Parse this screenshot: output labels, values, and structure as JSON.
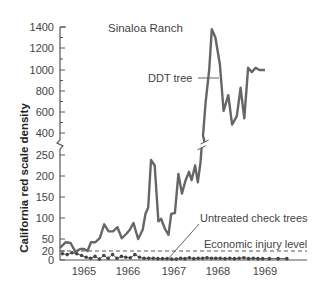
{
  "chart_data": {
    "type": "line",
    "title": "Sinaloa Ranch",
    "xlabel": "",
    "ylabel": "California red scale density",
    "x_tick_labels": [
      "1965",
      "1966",
      "1967",
      "1968",
      "1969"
    ],
    "y_tick_labels_lower": [
      "0",
      "20",
      "50",
      "100",
      "150",
      "200",
      "250"
    ],
    "y_tick_labels_upper": [
      "400",
      "600",
      "800",
      "1000",
      "1200",
      "1400"
    ],
    "y_axis_break": "between 250 and 400",
    "ylim": [
      0,
      1400
    ],
    "xlim": [
      1964.5,
      1969.4
    ],
    "grid": false,
    "legend_position": "inline annotations",
    "annotations": {
      "ddt_tree": "DDT tree",
      "untreated": "Untreated check trees",
      "economic_injury": "Economic injury level"
    },
    "economic_injury_level": 20,
    "series": [
      {
        "name": "DDT tree",
        "style": "thick solid line",
        "color": "#666666",
        "x": [
          1964.5,
          1964.62,
          1964.72,
          1964.82,
          1964.92,
          1965.0,
          1965.08,
          1965.16,
          1965.26,
          1965.36,
          1965.46,
          1965.56,
          1965.66,
          1965.76,
          1965.86,
          1965.96,
          1966.04,
          1966.12,
          1966.22,
          1966.32,
          1966.38,
          1966.44,
          1966.5,
          1966.58,
          1966.66,
          1966.72,
          1966.8,
          1966.88,
          1966.94,
          1967.02,
          1967.1,
          1967.18,
          1967.26,
          1967.34,
          1967.4,
          1967.48,
          1967.54,
          1967.6,
          1967.66,
          1967.72,
          1967.8,
          1967.86,
          1967.94,
          1968.04,
          1968.12,
          1968.22,
          1968.3,
          1968.4,
          1968.48,
          1968.56,
          1968.64,
          1968.72,
          1968.8,
          1968.88,
          1969.0
        ],
        "values": [
          28,
          42,
          40,
          18,
          25,
          25,
          20,
          42,
          42,
          52,
          85,
          68,
          68,
          78,
          52,
          62,
          72,
          88,
          50,
          72,
          110,
          125,
          238,
          225,
          92,
          98,
          75,
          60,
          110,
          112,
          205,
          158,
          188,
          210,
          190,
          225,
          185,
          230,
          380,
          700,
          1000,
          1380,
          1300,
          1050,
          610,
          760,
          480,
          560,
          830,
          540,
          1020,
          980,
          1020,
          1000,
          1000
        ]
      },
      {
        "name": "Untreated check trees",
        "style": "thin line with dot markers",
        "color": "#555555",
        "x": [
          1964.55,
          1964.65,
          1964.75,
          1964.85,
          1964.95,
          1965.05,
          1965.15,
          1965.25,
          1965.35,
          1965.45,
          1965.55,
          1965.65,
          1965.75,
          1965.85,
          1965.95,
          1966.05,
          1966.15,
          1966.25,
          1966.35,
          1966.45,
          1966.55,
          1966.65,
          1966.75,
          1966.85,
          1966.95,
          1967.05,
          1967.15,
          1967.25,
          1967.35,
          1967.45,
          1967.55,
          1967.65,
          1967.75,
          1967.85,
          1967.95,
          1968.05,
          1968.15,
          1968.25,
          1968.35,
          1968.45,
          1968.55,
          1968.65,
          1968.75,
          1968.85,
          1968.95,
          1969.05,
          1969.15,
          1969.25
        ],
        "values": [
          14,
          12,
          16,
          14,
          10,
          6,
          4,
          8,
          2,
          10,
          4,
          12,
          4,
          8,
          6,
          5,
          12,
          6,
          4,
          4,
          4,
          3,
          3,
          3,
          2,
          2,
          4,
          3,
          5,
          3,
          4,
          4,
          5,
          4,
          4,
          4,
          3,
          4,
          3,
          4,
          5,
          3,
          4,
          3,
          3,
          3,
          3,
          3
        ]
      }
    ]
  }
}
